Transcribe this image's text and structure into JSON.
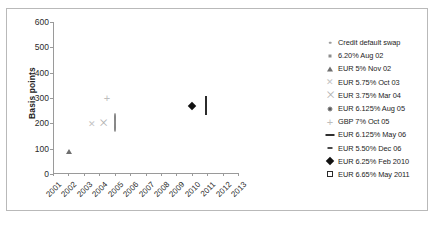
{
  "chart_data": {
    "type": "scatter",
    "title": "",
    "xlabel": "",
    "ylabel": "Basis points",
    "ylim": [
      0,
      600
    ],
    "ytick_labels": [
      "600",
      "500",
      "400",
      "300",
      "200",
      "100",
      "0"
    ],
    "ytick_values": [
      600,
      500,
      400,
      300,
      200,
      100,
      0
    ],
    "xlim": [
      2001,
      2013
    ],
    "xtick_labels": [
      "2001",
      "2002",
      "2003",
      "2004",
      "2005",
      "2006",
      "2007",
      "2008",
      "2009",
      "2010",
      "2011",
      "2012",
      "2013"
    ],
    "xtick_values": [
      2001,
      2002,
      2003,
      2004,
      2005,
      2006,
      2007,
      2008,
      2009,
      2010,
      2011,
      2012,
      2013
    ],
    "grid": false,
    "legend_position": "right",
    "series": [
      {
        "name": "Credit default swap",
        "marker": "dot-small",
        "color": "#9d9d9d",
        "points": [
          {
            "x": 2002.05,
            "y": 95
          },
          {
            "x": 2003.55,
            "y": 425
          },
          {
            "x": 2004.45,
            "y": 490
          },
          {
            "x": 2005.25,
            "y": 495
          },
          {
            "x": 2006.05,
            "y": 478
          },
          {
            "x": 2006.85,
            "y": 468
          },
          {
            "x": 2007.6,
            "y": 455
          },
          {
            "x": 2008.4,
            "y": 448
          },
          {
            "x": 2009.2,
            "y": 440
          },
          {
            "x": 2010.0,
            "y": 425
          },
          {
            "x": 2011.2,
            "y": 408
          }
        ]
      },
      {
        "name": "6.20% Aug 02",
        "marker": "dot-square",
        "color": "#8d8d8d",
        "points": [
          {
            "x": 2002.75,
            "y": 180
          }
        ]
      },
      {
        "name": "EUR 5% Nov 02",
        "marker": "triangle",
        "color": "#6f6f6f",
        "points": [
          {
            "x": 2002.05,
            "y": 130
          }
        ]
      },
      {
        "name": "EUR 5.75% Oct 03",
        "marker": "x-light",
        "color": "#c4c4c4",
        "points": [
          {
            "x": 2003.5,
            "y": 198
          }
        ]
      },
      {
        "name": "EUR 3.75% Mar 04",
        "marker": "x-bowtie",
        "color": "#b0b0b0",
        "points": [
          {
            "x": 2004.25,
            "y": 200
          }
        ]
      },
      {
        "name": "EUR 6.125% Aug 05",
        "marker": "circle-filled",
        "color": "#5a5a5a",
        "points": [
          {
            "x": 2005.0,
            "y": 200
          }
        ]
      },
      {
        "name": "GBP 7% Oct 05",
        "marker": "plus",
        "color": "#bdbdbd",
        "points": [
          {
            "x": 2004.5,
            "y": 300
          }
        ]
      },
      {
        "name": "EUR 6.125% May 06",
        "marker": "dash-long",
        "color": "#2e2e2e",
        "points": [
          {
            "x": 2005.8,
            "y": 200
          }
        ]
      },
      {
        "name": "EUR 5.50% Dec 06",
        "marker": "dash-short",
        "color": "#4a4a4a",
        "points": [
          {
            "x": 2006.15,
            "y": 200
          }
        ]
      },
      {
        "name": "EUR 6.25% Feb 2010",
        "marker": "diamond-filled",
        "color": "#111111",
        "points": [
          {
            "x": 2010.0,
            "y": 270
          }
        ]
      },
      {
        "name": "EUR 6.65% May 2011",
        "marker": "square-open",
        "color": "#2b2b2b",
        "points": [
          {
            "x": 2010.95,
            "y": 268
          }
        ]
      }
    ]
  }
}
